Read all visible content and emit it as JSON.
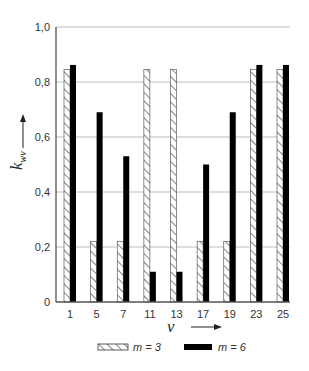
{
  "chart_data": {
    "type": "bar",
    "title": "",
    "xlabel": "ν",
    "ylabel": "k_wν",
    "ylabel_main": "k",
    "ylabel_sub": "wν",
    "categories": [
      "1",
      "5",
      "7",
      "11",
      "13",
      "17",
      "19",
      "23",
      "25"
    ],
    "series": [
      {
        "name": "m = 3",
        "pattern": "hatched",
        "values": [
          0.845,
          0.22,
          0.22,
          0.845,
          0.845,
          0.22,
          0.22,
          0.845,
          0.845
        ]
      },
      {
        "name": "m = 6",
        "pattern": "solid",
        "color": "#000000",
        "values": [
          0.862,
          0.69,
          0.53,
          0.11,
          0.11,
          0.5,
          0.69,
          0.862,
          0.862
        ]
      }
    ],
    "ylim": [
      0,
      1.0
    ],
    "yticks": [
      "0",
      "0,2",
      "0,4",
      "0,6",
      "0,8",
      "1,0"
    ],
    "ytick_values": [
      0,
      0.2,
      0.4,
      0.6,
      0.8,
      1.0
    ],
    "grid": true,
    "legend_position": "bottom"
  },
  "legend": {
    "items": [
      {
        "label": "m = 3",
        "pattern": "hatched"
      },
      {
        "label": "m = 6",
        "pattern": "solid"
      }
    ]
  },
  "colors": {
    "grid": "#bdbdbd",
    "axis": "#555555",
    "bar_solid": "#000000",
    "hatch": "#333333"
  }
}
